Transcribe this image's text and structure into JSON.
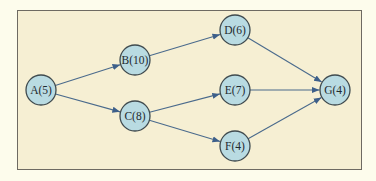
{
  "diagram": {
    "type": "network-activity-on-node",
    "colors": {
      "page_background": "#fdfcec",
      "frame_background": "#f6efd3",
      "frame_border": "#6e6a62",
      "node_fill": "#b9dbe2",
      "node_stroke": "#3f4a4e",
      "edge": "#4a6a8c"
    },
    "nodes": [
      {
        "id": "A",
        "label": "A(5)",
        "duration": 5,
        "x": 41,
        "y": 90
      },
      {
        "id": "B",
        "label": "B(10)",
        "duration": 10,
        "x": 135,
        "y": 60
      },
      {
        "id": "C",
        "label": "C(8)",
        "duration": 8,
        "x": 135,
        "y": 116
      },
      {
        "id": "D",
        "label": "D(6)",
        "duration": 6,
        "x": 235,
        "y": 30
      },
      {
        "id": "E",
        "label": "E(7)",
        "duration": 7,
        "x": 235,
        "y": 90
      },
      {
        "id": "F",
        "label": "F(4)",
        "duration": 4,
        "x": 235,
        "y": 146
      },
      {
        "id": "G",
        "label": "G(4)",
        "duration": 4,
        "x": 335,
        "y": 90
      }
    ],
    "edges": [
      {
        "from": "A",
        "to": "B"
      },
      {
        "from": "A",
        "to": "C"
      },
      {
        "from": "B",
        "to": "D"
      },
      {
        "from": "C",
        "to": "E"
      },
      {
        "from": "C",
        "to": "F"
      },
      {
        "from": "D",
        "to": "G"
      },
      {
        "from": "E",
        "to": "G"
      },
      {
        "from": "F",
        "to": "G"
      }
    ],
    "node_radius": 15
  }
}
